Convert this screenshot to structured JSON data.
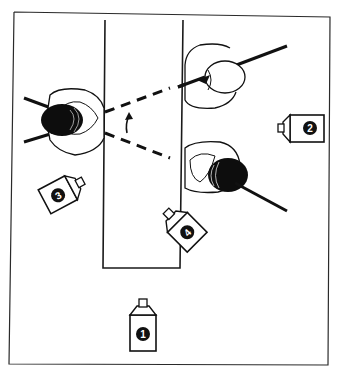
{
  "diagram": {
    "title": "",
    "colors": {
      "line": "#1a1a1a",
      "fill": "#ffffff",
      "hair": "#0d0d0d"
    },
    "cameras": [
      {
        "id": 1,
        "label": "1",
        "position": "bottom-center"
      },
      {
        "id": 2,
        "label": "2",
        "position": "right"
      },
      {
        "id": 3,
        "label": "3",
        "position": "left"
      },
      {
        "id": 4,
        "label": "4",
        "position": "center-bottom-right-of-table"
      }
    ],
    "people": [
      {
        "id": "left-person",
        "position": "left of table, facing right"
      },
      {
        "id": "right-top-person",
        "position": "right of table top, facing left"
      },
      {
        "id": "right-bottom-person",
        "position": "right of table bottom, facing left"
      }
    ],
    "annotations": {
      "gaze_lines": "dashed sightlines from left person to right people",
      "arrow": "curved arrow indicating gaze shift"
    }
  }
}
